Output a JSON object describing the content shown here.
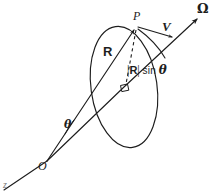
{
  "figure": {
    "type": "vector-diagram",
    "background_color": "#ffffff",
    "stroke_color": "#1d1d1d",
    "labels": {
      "omega": "Ω",
      "point_p": "P",
      "velocity": "V",
      "radius_vector": "R",
      "perp_distance_bars_open": "|",
      "perp_distance_r": "R",
      "perp_distance_bars_close": "|",
      "perp_distance_sin": "sin",
      "perp_distance_theta": "θ",
      "angle_theta": "θ",
      "origin": "O",
      "axis_tail": "z"
    },
    "geometry": {
      "origin_point": [
        47,
        161
      ],
      "point_p": [
        137,
        27
      ],
      "ellipse_center": [
        124,
        87
      ],
      "axis_arrow_tip": [
        200,
        17
      ],
      "ellipse_rx": 33,
      "ellipse_ry": 61,
      "right_angle_marker": [
        124,
        87
      ]
    }
  }
}
